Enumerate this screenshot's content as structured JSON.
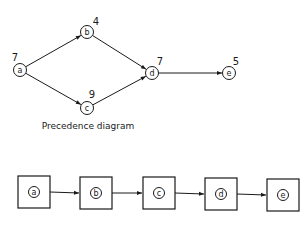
{
  "precedence_diagram": {
    "caption": "Precedence diagram",
    "nodes": [
      {
        "id": "a",
        "label": "a",
        "weight": "7",
        "x": 20,
        "y": 70,
        "wx": 15,
        "wy": 61
      },
      {
        "id": "b",
        "label": "b",
        "weight": "4",
        "x": 87,
        "y": 32,
        "wx": 96,
        "wy": 25
      },
      {
        "id": "c",
        "label": "c",
        "weight": "9",
        "x": 87,
        "y": 108,
        "wx": 92,
        "wy": 98
      },
      {
        "id": "d",
        "label": "d",
        "weight": "7",
        "x": 152,
        "y": 73,
        "wx": 160,
        "wy": 65
      },
      {
        "id": "e",
        "label": "e",
        "weight": "5",
        "x": 229,
        "y": 73,
        "wx": 236,
        "wy": 65
      }
    ],
    "edges": [
      {
        "from": "a",
        "to": "b"
      },
      {
        "from": "a",
        "to": "c"
      },
      {
        "from": "b",
        "to": "d"
      },
      {
        "from": "c",
        "to": "d"
      },
      {
        "from": "d",
        "to": "e"
      }
    ]
  },
  "sequence_diagram": {
    "boxes": [
      {
        "id": "a",
        "label": "a",
        "x": 18,
        "y": 176
      },
      {
        "id": "b",
        "label": "b",
        "x": 80,
        "y": 177
      },
      {
        "id": "c",
        "label": "c",
        "x": 143,
        "y": 177
      },
      {
        "id": "d",
        "label": "d",
        "x": 205,
        "y": 178
      },
      {
        "id": "e",
        "label": "e",
        "x": 267,
        "y": 179
      }
    ],
    "box_size": 32
  }
}
